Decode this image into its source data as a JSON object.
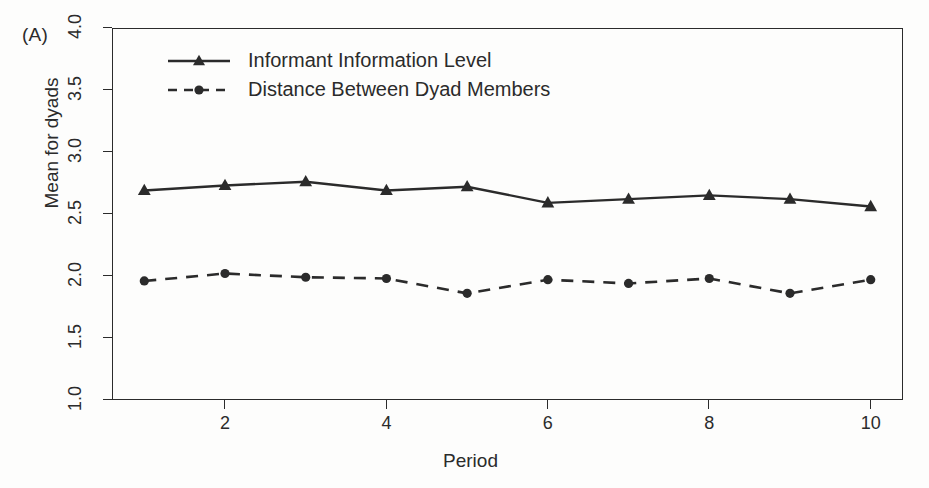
{
  "panel": {
    "label": "(A)"
  },
  "axes": {
    "xlabel": "Period",
    "ylabel": "Mean for dyads",
    "yticks": [
      "1.0",
      "1.5",
      "2.0",
      "2.5",
      "3.0",
      "3.5",
      "4.0"
    ],
    "xticks": [
      "2",
      "4",
      "6",
      "8",
      "10"
    ]
  },
  "legend": {
    "entries": [
      {
        "label": "Informant Information Level",
        "style": "solid",
        "marker": "triangle"
      },
      {
        "label": "Distance Between Dyad Members",
        "style": "dashed",
        "marker": "circle"
      }
    ]
  },
  "colors": {
    "ink": "#2b2b2b",
    "background": "#fdfdfc"
  },
  "chart_data": {
    "type": "line",
    "title": "",
    "subtitle": "",
    "xlabel": "Period",
    "ylabel": "Mean for dyads",
    "x": [
      1,
      2,
      3,
      4,
      5,
      6,
      7,
      8,
      9,
      10
    ],
    "xlim": [
      0.6,
      10.4
    ],
    "ylim": [
      1.0,
      4.0
    ],
    "xtick_values": [
      2,
      4,
      6,
      8,
      10
    ],
    "ytick_values": [
      1.0,
      1.5,
      2.0,
      2.5,
      3.0,
      3.5,
      4.0
    ],
    "grid": false,
    "legend_position": "upper-left-inside",
    "annotations": [
      "(A)"
    ],
    "series": [
      {
        "name": "Informant Information Level",
        "style": "solid",
        "marker": "triangle",
        "values": [
          2.69,
          2.73,
          2.76,
          2.69,
          2.72,
          2.59,
          2.62,
          2.65,
          2.62,
          2.56
        ]
      },
      {
        "name": "Distance Between Dyad Members",
        "style": "dashed",
        "marker": "circle",
        "values": [
          1.96,
          2.02,
          1.99,
          1.98,
          1.86,
          1.97,
          1.94,
          1.98,
          1.86,
          1.97
        ]
      }
    ]
  }
}
